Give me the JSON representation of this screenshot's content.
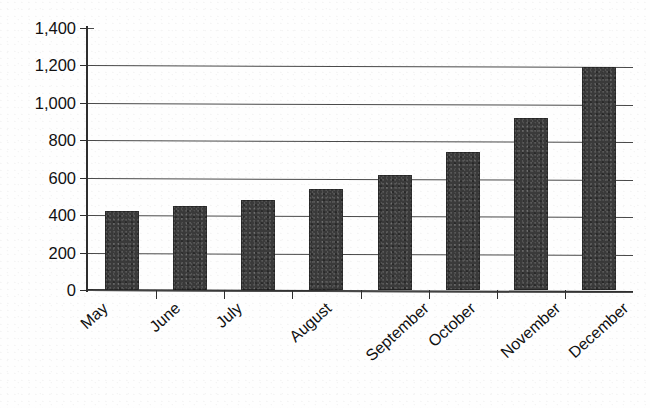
{
  "chart_data": {
    "type": "bar",
    "title": "",
    "xlabel": "",
    "ylabel": "",
    "categories": [
      "May",
      "June",
      "July",
      "August",
      "September",
      "October",
      "November",
      "December"
    ],
    "values": [
      420,
      450,
      480,
      540,
      615,
      740,
      920,
      1190
    ],
    "series": [
      {
        "name": "Monthly total",
        "values": [
          420,
          450,
          480,
          540,
          615,
          740,
          920,
          1190
        ]
      }
    ],
    "ylim": [
      0,
      1400
    ],
    "y_ticks": [
      0,
      200,
      400,
      600,
      800,
      1000,
      1200,
      1400
    ],
    "y_tick_labels": [
      "0",
      "200",
      "400",
      "600",
      "800",
      "1,000",
      "1,200",
      "1,400"
    ],
    "grid": true,
    "grid_axis": "y",
    "legend": false,
    "legend_position": "none",
    "bar_color": "#3a3a3a",
    "axis_color": "#2e2e2e",
    "background_color": "#ffffff",
    "x_tick_label_rotation": -42
  },
  "figure": {
    "title_fragment": ""
  }
}
